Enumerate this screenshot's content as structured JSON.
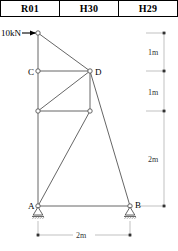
{
  "header": {
    "cells": [
      {
        "label": "R01"
      },
      {
        "label": "H30"
      },
      {
        "label": "H29"
      }
    ]
  },
  "diagram": {
    "load": {
      "label": "10kN",
      "direction": "horizontal-right",
      "applied_at": "top-node"
    },
    "node_labels": {
      "a": "A",
      "b": "B",
      "c": "C",
      "d": "D"
    },
    "supports": {
      "a": "pin-support",
      "b": "pin-support"
    },
    "dimensions": {
      "right_chain": [
        {
          "label": "1m"
        },
        {
          "label": "1m"
        },
        {
          "label": "2m"
        }
      ],
      "bottom": {
        "label": "2m"
      }
    },
    "colors": {
      "member": "#555555",
      "node_stroke": "#555555",
      "node_fill": "#ffffff",
      "dimension": "#888888",
      "text": "#000000"
    }
  }
}
